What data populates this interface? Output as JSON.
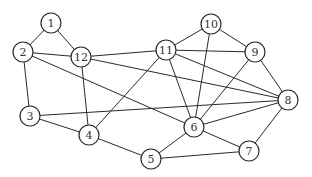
{
  "graph": {
    "type": "undirected",
    "node_radius": 10,
    "colors": {
      "edge": "#2a2a2a",
      "node_fill": "#ffffff",
      "node_stroke": "#2a2a2a",
      "label": "#333333"
    },
    "nodes": [
      {
        "id": "1",
        "label": "1",
        "x": 51,
        "y": 23
      },
      {
        "id": "2",
        "label": "2",
        "x": 23,
        "y": 52
      },
      {
        "id": "3",
        "label": "3",
        "x": 30,
        "y": 116
      },
      {
        "id": "4",
        "label": "4",
        "x": 89,
        "y": 135
      },
      {
        "id": "5",
        "label": "5",
        "x": 151,
        "y": 159
      },
      {
        "id": "6",
        "label": "6",
        "x": 194,
        "y": 127
      },
      {
        "id": "7",
        "label": "7",
        "x": 249,
        "y": 151
      },
      {
        "id": "8",
        "label": "8",
        "x": 288,
        "y": 100
      },
      {
        "id": "9",
        "label": "9",
        "x": 255,
        "y": 52
      },
      {
        "id": "10",
        "label": "10",
        "x": 211,
        "y": 24
      },
      {
        "id": "11",
        "label": "11",
        "x": 166,
        "y": 50
      },
      {
        "id": "12",
        "label": "12",
        "x": 81,
        "y": 57
      }
    ],
    "edges": [
      [
        "1",
        "2"
      ],
      [
        "1",
        "12"
      ],
      [
        "2",
        "12"
      ],
      [
        "2",
        "3"
      ],
      [
        "2",
        "6"
      ],
      [
        "12",
        "11"
      ],
      [
        "12",
        "8"
      ],
      [
        "12",
        "4"
      ],
      [
        "11",
        "10"
      ],
      [
        "11",
        "9"
      ],
      [
        "11",
        "8"
      ],
      [
        "11",
        "6"
      ],
      [
        "11",
        "4"
      ],
      [
        "10",
        "9"
      ],
      [
        "10",
        "6"
      ],
      [
        "9",
        "6"
      ],
      [
        "9",
        "8"
      ],
      [
        "3",
        "4"
      ],
      [
        "3",
        "8"
      ],
      [
        "4",
        "5"
      ],
      [
        "5",
        "6"
      ],
      [
        "5",
        "7"
      ],
      [
        "6",
        "7"
      ],
      [
        "6",
        "8"
      ],
      [
        "7",
        "8"
      ]
    ]
  }
}
